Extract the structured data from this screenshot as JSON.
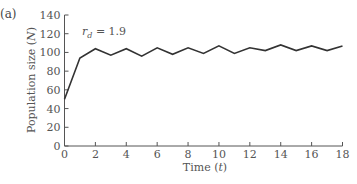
{
  "panel_label": "(a)",
  "annotation": {
    "symbol": "r",
    "subscript": "d",
    "text": " = 1.9"
  },
  "chart_data": {
    "type": "line",
    "title": "",
    "xlabel": "Time (t)",
    "xlabel_parts": {
      "text": "Time (",
      "var": "t",
      "close": ")"
    },
    "ylabel": "Population size (N)",
    "ylabel_parts": {
      "text": "Population size (",
      "var": "N",
      "close": ")"
    },
    "xlim": [
      0,
      18
    ],
    "ylim": [
      0,
      140
    ],
    "xticks": [
      0,
      2,
      4,
      6,
      8,
      10,
      12,
      14,
      16,
      18
    ],
    "yticks": [
      0,
      20,
      40,
      60,
      80,
      100,
      120,
      140
    ],
    "grid": false,
    "legend": null,
    "series": [
      {
        "name": "r_d = 1.9",
        "x": [
          0,
          1,
          2,
          3,
          4,
          5,
          6,
          7,
          8,
          9,
          10,
          11,
          12,
          13,
          14,
          15,
          16,
          17,
          18
        ],
        "values": [
          50,
          94,
          104,
          97,
          104,
          96,
          105,
          98,
          105,
          99,
          107,
          99,
          105,
          102,
          108,
          102,
          107,
          102,
          107
        ]
      }
    ],
    "annotations": [
      {
        "text": "r_d = 1.9",
        "x": 1,
        "y": 118
      }
    ]
  },
  "colors": {
    "line": "#333333",
    "axis": "#555555",
    "text": "#555555"
  }
}
